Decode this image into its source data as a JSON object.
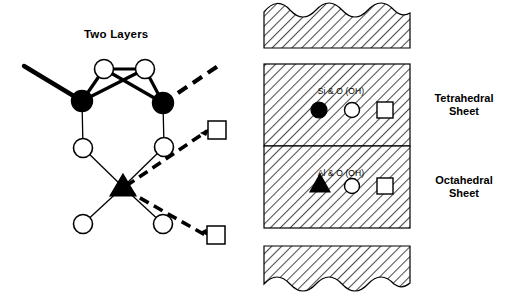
{
  "figure": {
    "title": "Two Layers",
    "domain_type": "diagram"
  },
  "model": {
    "title": "Two Layers",
    "nodes": [
      {
        "id": "si-left",
        "kind": "filled-circle",
        "label": "Si",
        "x": 82,
        "y": 101
      },
      {
        "id": "si-right",
        "kind": "filled-circle",
        "label": "Si",
        "x": 163,
        "y": 103
      },
      {
        "id": "o-top-left",
        "kind": "open-circle",
        "label": "O",
        "x": 104,
        "y": 69
      },
      {
        "id": "o-top-right",
        "kind": "open-circle",
        "label": "O",
        "x": 145,
        "y": 69
      },
      {
        "id": "o-mid-left",
        "kind": "open-circle",
        "label": "O",
        "x": 83,
        "y": 148
      },
      {
        "id": "o-mid-right",
        "kind": "open-circle",
        "label": "O",
        "x": 164,
        "y": 147
      },
      {
        "id": "al-center",
        "kind": "filled-triangle",
        "label": "Al",
        "x": 123,
        "y": 187
      },
      {
        "id": "oh-bot-left",
        "kind": "open-circle",
        "label": "OH",
        "x": 83,
        "y": 224
      },
      {
        "id": "oh-bot-right",
        "kind": "open-circle",
        "label": "OH",
        "x": 163,
        "y": 224
      },
      {
        "id": "sq-upper",
        "kind": "open-square",
        "label": "OH",
        "x": 217,
        "y": 130
      },
      {
        "id": "sq-lower",
        "kind": "open-square",
        "label": "OH",
        "x": 216,
        "y": 235
      }
    ]
  },
  "sheets": {
    "top_block": {
      "name": "upper-wavy-block",
      "edge": "wavy-top"
    },
    "tetrahedral": {
      "name": "Tetrahedral Sheet",
      "label": "Tetrahedral\nSheet",
      "legend_text": "Si & O (OH)",
      "symbols": [
        "filled-circle",
        "open-circle",
        "open-square"
      ]
    },
    "octahedral": {
      "name": "Octahedral Sheet",
      "label": "Octahedral\nSheet",
      "legend_text": "Al & O (OH)",
      "symbols": [
        "filled-triangle",
        "open-circle",
        "open-square"
      ]
    },
    "bottom_block": {
      "name": "lower-wavy-block",
      "edge": "wavy-bottom"
    }
  },
  "style": {
    "ink": "#000000",
    "background": "#ffffff",
    "hatch": "#555555",
    "hatch_fill": "#ffffff"
  }
}
